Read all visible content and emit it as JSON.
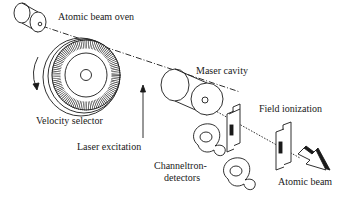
{
  "diagram": {
    "type": "apparatus schematic",
    "labels": {
      "oven": "Atomic beam oven",
      "velocity_selector": "Velocity selector",
      "laser": "Laser excitation",
      "maser": "Maser cavity",
      "field_ionization": "Field ionization",
      "channeltron_line1": "Channeltron-",
      "channeltron_line2": "detectors",
      "atomic_beam": "Atomic beam"
    },
    "colors": {
      "stroke": "#1a1a1a",
      "fill": "#ffffff"
    }
  }
}
